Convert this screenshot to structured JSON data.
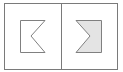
{
  "diagram": {
    "title": "",
    "colors": {
      "background": "#ffffff",
      "frame_stroke": "#7a7a7a",
      "shape_stroke": "#808080",
      "filled_shape": "#e4e4e4"
    },
    "panels": [
      {
        "id": "left",
        "shape": "notched-rectangle-outline",
        "notch_direction": "left",
        "filled": false
      },
      {
        "id": "right",
        "shape": "chevron-notched-shape",
        "notch_direction": "right",
        "filled": true
      }
    ]
  }
}
